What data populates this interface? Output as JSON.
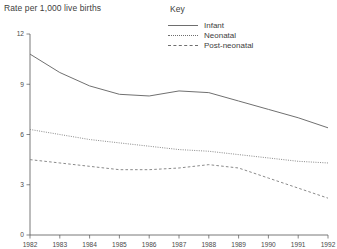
{
  "chart_data": {
    "type": "line",
    "title": "Rate per 1,000 live births",
    "xlabel": "",
    "ylabel": "Rate per 1,000 live births",
    "x": [
      1982,
      1983,
      1984,
      1985,
      1986,
      1987,
      1988,
      1989,
      1990,
      1991,
      1992
    ],
    "categories": [
      "1982",
      "1983",
      "1984",
      "1985",
      "1986",
      "1987",
      "1988",
      "1989",
      "1990",
      "1991",
      "1992"
    ],
    "xlim": [
      1982,
      1992
    ],
    "ylim": [
      0,
      12
    ],
    "yticks": [
      0,
      3,
      6,
      9,
      12
    ],
    "ytick_labels": [
      "0",
      "3",
      "6",
      "9",
      "12"
    ],
    "grid": false,
    "legend_position": "top-center",
    "legend_title": "Key",
    "series": [
      {
        "name": "Infant",
        "style": "solid",
        "color": "#707070",
        "values": [
          10.8,
          9.7,
          8.9,
          8.4,
          8.3,
          8.6,
          8.5,
          8.0,
          7.5,
          7.0,
          6.4
        ]
      },
      {
        "name": "Neonatal",
        "style": "dotted",
        "color": "#8a8a8a",
        "values": [
          6.3,
          6.0,
          5.7,
          5.5,
          5.3,
          5.1,
          5.0,
          4.8,
          4.6,
          4.4,
          4.3
        ]
      },
      {
        "name": "Post-neonatal",
        "style": "dashed",
        "color": "#8a8a8a",
        "values": [
          4.5,
          4.3,
          4.1,
          3.9,
          3.9,
          4.0,
          4.2,
          4.0,
          3.4,
          2.8,
          2.2
        ]
      }
    ]
  },
  "legend": {
    "title": "Key",
    "items": [
      {
        "label": "Infant",
        "style": "solid"
      },
      {
        "label": "Neonatal",
        "style": "dotted"
      },
      {
        "label": "Post-neonatal",
        "style": "dashed"
      }
    ]
  },
  "axes": {
    "y_title": "Rate per 1,000 live births"
  }
}
